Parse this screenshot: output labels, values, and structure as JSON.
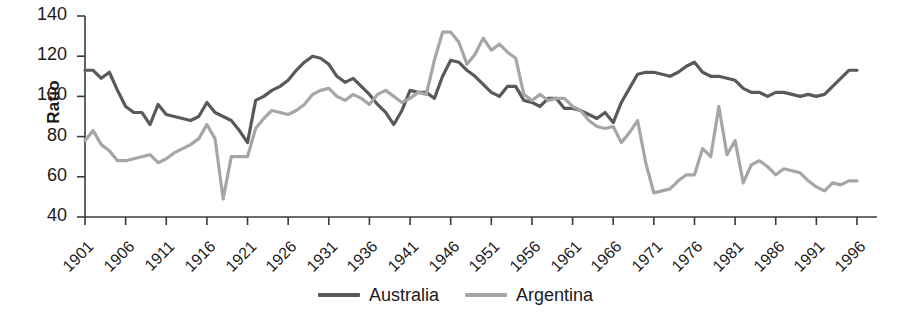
{
  "chart_data": {
    "type": "line",
    "title": "",
    "xlabel": "",
    "ylabel": "Ratio",
    "xlim": [
      1901,
      1996
    ],
    "ylim": [
      40,
      140
    ],
    "yticks": [
      40,
      60,
      80,
      100,
      120,
      140
    ],
    "xticks": [
      1901,
      1906,
      1911,
      1916,
      1921,
      1926,
      1931,
      1936,
      1941,
      1946,
      1951,
      1956,
      1961,
      1966,
      1971,
      1976,
      1981,
      1986,
      1991,
      1996
    ],
    "grid": false,
    "legend_position": "bottom-center",
    "x": [
      1901,
      1902,
      1903,
      1904,
      1905,
      1906,
      1907,
      1908,
      1909,
      1910,
      1911,
      1912,
      1913,
      1914,
      1915,
      1916,
      1917,
      1918,
      1919,
      1920,
      1921,
      1922,
      1923,
      1924,
      1925,
      1926,
      1927,
      1928,
      1929,
      1930,
      1931,
      1932,
      1933,
      1934,
      1935,
      1936,
      1937,
      1938,
      1939,
      1940,
      1941,
      1942,
      1943,
      1944,
      1945,
      1946,
      1947,
      1948,
      1949,
      1950,
      1951,
      1952,
      1953,
      1954,
      1955,
      1956,
      1957,
      1958,
      1959,
      1960,
      1961,
      1962,
      1963,
      1964,
      1965,
      1966,
      1967,
      1968,
      1969,
      1970,
      1971,
      1972,
      1973,
      1974,
      1975,
      1976,
      1977,
      1978,
      1979,
      1980,
      1981,
      1982,
      1983,
      1984,
      1985,
      1986,
      1987,
      1988,
      1989,
      1990,
      1991,
      1992,
      1993,
      1994,
      1995,
      1996
    ],
    "series": [
      {
        "name": "Australia",
        "color": "#595959",
        "values": [
          113,
          113,
          109,
          112,
          103,
          95,
          92,
          92,
          86,
          96,
          91,
          90,
          89,
          88,
          90,
          97,
          92,
          90,
          88,
          83,
          77,
          98,
          100,
          103,
          105,
          108,
          113,
          117,
          120,
          119,
          116,
          110,
          107,
          109,
          105,
          101,
          96,
          92,
          86,
          93,
          103,
          102,
          102,
          99,
          110,
          118,
          117,
          113,
          110,
          106,
          102,
          100,
          105,
          105,
          98,
          97,
          95,
          99,
          99,
          94,
          94,
          93,
          91,
          89,
          92,
          87,
          97,
          104,
          111,
          112,
          112,
          111,
          110,
          112,
          115,
          117,
          112,
          110,
          110,
          109,
          108,
          104,
          102,
          102,
          100,
          102,
          102,
          101,
          100,
          101,
          100,
          101,
          105,
          109,
          113,
          113
        ]
      },
      {
        "name": "Argentina",
        "color": "#a6a6a6",
        "values": [
          78,
          83,
          76,
          73,
          68,
          68,
          69,
          70,
          71,
          67,
          69,
          72,
          74,
          76,
          79,
          86,
          79,
          49,
          70,
          70,
          70,
          84,
          89,
          93,
          92,
          91,
          93,
          96,
          101,
          103,
          104,
          100,
          98,
          101,
          99,
          96,
          101,
          103,
          100,
          97,
          99,
          102,
          101,
          118,
          132,
          132,
          127,
          116,
          121,
          129,
          123,
          126,
          122,
          119,
          101,
          98,
          101,
          98,
          99,
          99,
          95,
          93,
          88,
          85,
          84,
          85,
          77,
          82,
          88,
          67,
          52,
          53,
          54,
          58,
          61,
          61,
          74,
          70,
          95,
          71,
          78,
          57,
          66,
          68,
          65,
          61,
          64,
          63,
          62,
          58,
          55,
          53,
          57,
          56,
          58,
          58
        ]
      }
    ]
  },
  "legend": {
    "items": [
      {
        "label": "Australia",
        "color": "#595959"
      },
      {
        "label": "Argentina",
        "color": "#a6a6a6"
      }
    ]
  },
  "axes": {
    "y_title": "Ratio",
    "y_tick_labels": [
      "140",
      "120",
      "100",
      "80",
      "60",
      "40"
    ],
    "x_tick_labels": [
      "1901",
      "1906",
      "1911",
      "1916",
      "1921",
      "1926",
      "1931",
      "1936",
      "1941",
      "1946",
      "1951",
      "1956",
      "1961",
      "1966",
      "1971",
      "1976",
      "1981",
      "1986",
      "1991",
      "1996"
    ]
  }
}
